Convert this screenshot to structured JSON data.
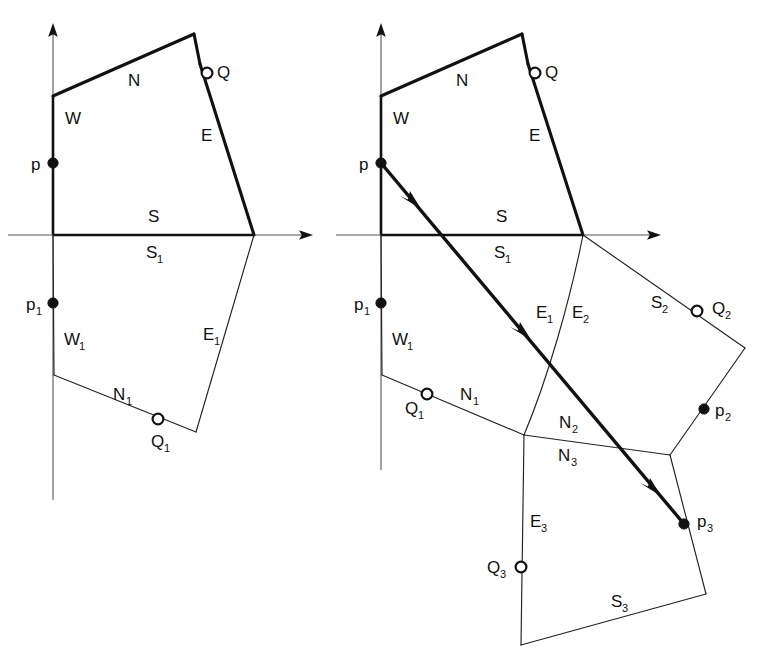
{
  "figure": {
    "background_color": "#ffffff",
    "line_color": "#111111",
    "panels": [
      {
        "id": "left-panel",
        "name": "initial-configuration",
        "axes": {
          "origin": {
            "x": 53,
            "y": 235
          },
          "y_axis": {
            "x": 53,
            "y_top": 25,
            "y_bottom": 500
          },
          "x_axis": {
            "y": 235,
            "x_left": 8,
            "x_right": 312
          },
          "y_arrow_tip": {
            "x": 53,
            "y": 25
          },
          "x_arrow_tip": {
            "x": 312,
            "y": 235
          }
        },
        "labels": [
          {
            "text": "N",
            "sub": "",
            "x": 128,
            "y": 86
          },
          {
            "text": "W",
            "sub": "",
            "x": 65,
            "y": 124
          },
          {
            "text": "E",
            "sub": "",
            "x": 201,
            "y": 141
          },
          {
            "text": "Q",
            "sub": "",
            "x": 217,
            "y": 78
          },
          {
            "text": "S",
            "sub": "",
            "x": 148,
            "y": 222
          },
          {
            "text": "S",
            "sub": "1",
            "x": 146,
            "y": 258
          },
          {
            "text": "p",
            "sub": "",
            "x": 31,
            "y": 170
          },
          {
            "text": "p",
            "sub": "1",
            "x": 26,
            "y": 310
          },
          {
            "text": "W",
            "sub": "1",
            "x": 64,
            "y": 345
          },
          {
            "text": "N",
            "sub": "1",
            "x": 113,
            "y": 400
          },
          {
            "text": "E",
            "sub": "1",
            "x": 203,
            "y": 340
          },
          {
            "text": "Q",
            "sub": "1",
            "x": 151,
            "y": 447
          }
        ],
        "points": [
          {
            "name": "p",
            "kind": "filled",
            "x": 53,
            "y": 163
          },
          {
            "name": "Q",
            "kind": "open",
            "x": 207,
            "y": 73
          },
          {
            "name": "p1",
            "kind": "filled",
            "x": 53,
            "y": 303
          },
          {
            "name": "Q1",
            "kind": "open",
            "x": 158,
            "y": 419
          }
        ]
      },
      {
        "id": "right-panel",
        "name": "traversal-configuration",
        "axes": {
          "origin": {
            "x": 381,
            "y": 235
          },
          "y_axis": {
            "x": 381,
            "y_top": 25,
            "y_bottom": 470
          },
          "x_axis": {
            "y": 235,
            "x_left": 336,
            "x_right": 660
          },
          "y_arrow_tip": {
            "x": 381,
            "y": 25
          },
          "x_arrow_tip": {
            "x": 660,
            "y": 235
          }
        },
        "labels": [
          {
            "text": "N",
            "sub": "",
            "x": 456,
            "y": 86
          },
          {
            "text": "W",
            "sub": "",
            "x": 393,
            "y": 124
          },
          {
            "text": "E",
            "sub": "",
            "x": 529,
            "y": 141
          },
          {
            "text": "Q",
            "sub": "",
            "x": 545,
            "y": 78
          },
          {
            "text": "S",
            "sub": "",
            "x": 496,
            "y": 222
          },
          {
            "text": "S",
            "sub": "1",
            "x": 494,
            "y": 258
          },
          {
            "text": "p",
            "sub": "",
            "x": 359,
            "y": 170
          },
          {
            "text": "p",
            "sub": "1",
            "x": 354,
            "y": 310
          },
          {
            "text": "W",
            "sub": "1",
            "x": 392,
            "y": 345
          },
          {
            "text": "N",
            "sub": "1",
            "x": 460,
            "y": 400
          },
          {
            "text": "Q",
            "sub": "1",
            "x": 405,
            "y": 414
          },
          {
            "text": "E",
            "sub": "1",
            "x": 536,
            "y": 318
          },
          {
            "text": "E",
            "sub": "2",
            "x": 572,
            "y": 318
          },
          {
            "text": "S",
            "sub": "2",
            "x": 651,
            "y": 308
          },
          {
            "text": "Q",
            "sub": "2",
            "x": 712,
            "y": 314
          },
          {
            "text": "p",
            "sub": "2",
            "x": 715,
            "y": 416
          },
          {
            "text": "N",
            "sub": "2",
            "x": 559,
            "y": 428
          },
          {
            "text": "N",
            "sub": "3",
            "x": 558,
            "y": 461
          },
          {
            "text": "E",
            "sub": "3",
            "x": 530,
            "y": 527
          },
          {
            "text": "Q",
            "sub": "3",
            "x": 487,
            "y": 573
          },
          {
            "text": "p",
            "sub": "3",
            "x": 697,
            "y": 527
          },
          {
            "text": "S",
            "sub": "3",
            "x": 611,
            "y": 607
          }
        ],
        "points": [
          {
            "name": "p",
            "kind": "filled",
            "x": 381,
            "y": 163
          },
          {
            "name": "Q",
            "kind": "open",
            "x": 535,
            "y": 73
          },
          {
            "name": "p1",
            "kind": "filled",
            "x": 381,
            "y": 303
          },
          {
            "name": "Q1",
            "kind": "open",
            "x": 427,
            "y": 394
          },
          {
            "name": "Q2",
            "kind": "open",
            "x": 697,
            "y": 311
          },
          {
            "name": "p2",
            "kind": "filled",
            "x": 704,
            "y": 409
          },
          {
            "name": "Q3",
            "kind": "open",
            "x": 521,
            "y": 567
          },
          {
            "name": "p3",
            "kind": "filled",
            "x": 684,
            "y": 524
          }
        ],
        "ray": {
          "name": "traversal-ray",
          "from": {
            "x": 381,
            "y": 163
          },
          "to": {
            "x": 684,
            "y": 524
          },
          "arrow_count": 3
        }
      }
    ]
  }
}
